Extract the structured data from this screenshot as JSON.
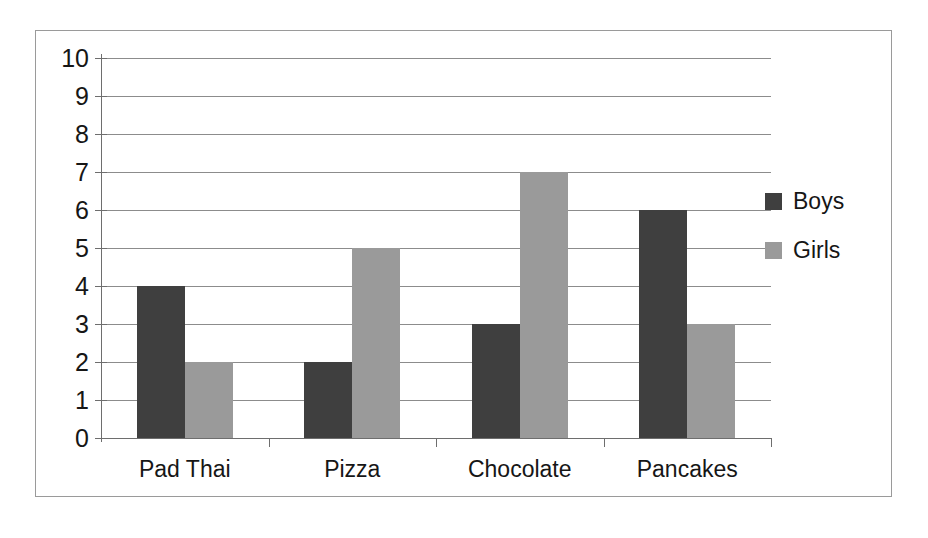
{
  "chart_data": {
    "type": "bar",
    "title": "",
    "xlabel": "",
    "ylabel": "",
    "ylim": [
      0,
      10
    ],
    "ytick_step": 1,
    "yticks": [
      10,
      9,
      8,
      7,
      6,
      5,
      4,
      3,
      2,
      1,
      0
    ],
    "grid": true,
    "legend_position": "right",
    "categories": [
      "Pad Thai",
      "Pizza",
      "Chocolate",
      "Pancakes"
    ],
    "series": [
      {
        "name": "Boys",
        "color": "#3f3f3f",
        "values": [
          4,
          2,
          3,
          6
        ]
      },
      {
        "name": "Girls",
        "color": "#9a9a9a",
        "values": [
          2,
          5,
          7,
          3
        ]
      }
    ]
  },
  "legend": {
    "items": [
      {
        "label": "Boys"
      },
      {
        "label": "Girls"
      }
    ]
  },
  "colors": {
    "boys": "#3f3f3f",
    "girls": "#9a9a9a",
    "gridline": "#8c8c8c",
    "axis": "#6e6e6e",
    "frame": "#9a9a9a",
    "text": "#161616",
    "background": "#ffffff"
  }
}
